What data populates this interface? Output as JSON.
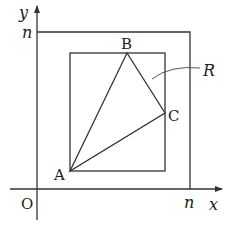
{
  "diagram": {
    "axes": {
      "x_label": "x",
      "y_label": "y",
      "origin_label": "O",
      "x_tick_label": "n",
      "y_tick_label": "n"
    },
    "outer_square_label": "n",
    "region_label": "R",
    "points": [
      {
        "id": "A",
        "label": "A"
      },
      {
        "id": "B",
        "label": "B"
      },
      {
        "id": "C",
        "label": "C"
      }
    ],
    "colors": {
      "stroke": "#333333",
      "text": "#222222",
      "background": "#ffffff"
    }
  }
}
